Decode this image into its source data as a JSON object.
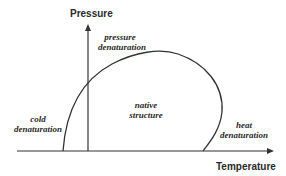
{
  "diagram": {
    "type": "phase-diagram",
    "axes": {
      "y_label": "Pressure",
      "x_label": "Temperature"
    },
    "regions": {
      "pressure": {
        "line1": "pressure",
        "line2": "denaturation"
      },
      "cold": {
        "line1": "cold",
        "line2": "denaturation"
      },
      "native": {
        "line1": "native",
        "line2": "structure"
      },
      "heat": {
        "line1": "heat",
        "line2": "denaturation"
      }
    },
    "colors": {
      "line": "#333333",
      "text": "#2a2a2a",
      "background": "#ffffff"
    }
  }
}
